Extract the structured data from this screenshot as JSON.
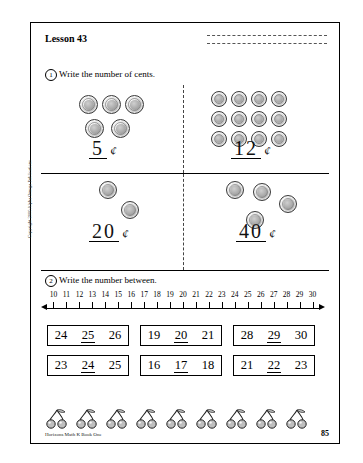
{
  "page": {
    "lesson_title": "Lesson 43",
    "page_number": "85",
    "footer": "Horizons Math K Book One",
    "side_credit": "Copyright 2000 Alpha Omega Publications"
  },
  "exercise1": {
    "number": "1",
    "instruction": "Write the number of cents.",
    "cell_top_left": {
      "coins": 5,
      "coin_type": "nickel",
      "answer": "5",
      "unit": "¢"
    },
    "cell_top_right": {
      "coins": 12,
      "coin_type": "penny",
      "answer": "12",
      "unit": "¢"
    },
    "cell_bottom_left": {
      "coins": 2,
      "coin_type": "dime",
      "answer": "20",
      "unit": "¢"
    },
    "cell_bottom_right": {
      "coins": 4,
      "coin_type": "dime",
      "answer": "40",
      "unit": "¢"
    }
  },
  "exercise2": {
    "number": "2",
    "instruction": "Write the number between.",
    "numberline": {
      "labels": [
        "10",
        "11",
        "12",
        "13",
        "14",
        "15",
        "16",
        "17",
        "18",
        "19",
        "20",
        "21",
        "22",
        "23",
        "24",
        "25",
        "26",
        "27",
        "28",
        "29",
        "30"
      ]
    },
    "rows": [
      [
        {
          "left": "24",
          "middle": "25",
          "right": "26"
        },
        {
          "left": "19",
          "middle": "20",
          "right": "21"
        },
        {
          "left": "28",
          "middle": "29",
          "right": "30"
        }
      ],
      [
        {
          "left": "23",
          "middle": "24",
          "right": "25"
        },
        {
          "left": "16",
          "middle": "17",
          "right": "18"
        },
        {
          "left": "21",
          "middle": "22",
          "right": "23"
        }
      ]
    ]
  },
  "decoration": {
    "cherry_count": 9,
    "icon": "cherry-icon"
  }
}
